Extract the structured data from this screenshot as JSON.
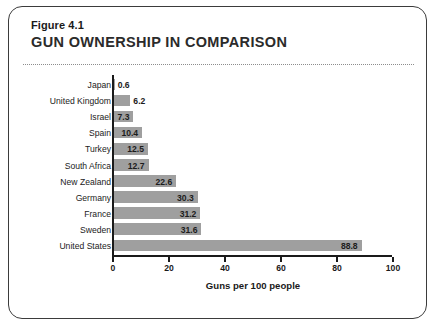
{
  "figure": {
    "number": "Figure 4.1",
    "title": "GUN OWNERSHIP IN COMPARISON"
  },
  "chart_data": {
    "type": "bar",
    "orientation": "horizontal",
    "title": "GUN OWNERSHIP IN COMPARISON",
    "xlabel": "Guns per 100 people",
    "ylabel": "",
    "xlim": [
      0,
      100
    ],
    "xticks": [
      0,
      20,
      40,
      60,
      80,
      100
    ],
    "grid": false,
    "legend": false,
    "bar_color": "#9f9f9f",
    "categories": [
      "Japan",
      "United Kingdom",
      "Israel",
      "Spain",
      "Turkey",
      "South Africa",
      "New Zealand",
      "Germany",
      "France",
      "Sweden",
      "United States"
    ],
    "values": [
      0.6,
      6.2,
      7.3,
      10.4,
      12.5,
      12.7,
      22.6,
      30.3,
      31.2,
      31.6,
      88.8
    ],
    "value_labels": [
      "0.6",
      "6.2",
      "7.3",
      "10.4",
      "12.5",
      "12.7",
      "22.6",
      "30.3",
      "31.2",
      "31.6",
      "88.8"
    ],
    "tick_labels": [
      "0",
      "20",
      "40",
      "60",
      "80",
      "100"
    ]
  }
}
